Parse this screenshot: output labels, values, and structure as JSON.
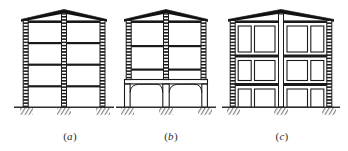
{
  "figure": {
    "domain": "Diagram",
    "kind": "structural-frame-elevation-set",
    "background_color": "#ffffff",
    "line_color": "#1a1a1a",
    "fill_color": "#111111",
    "ground_color": "#333333",
    "panels": [
      {
        "id": "a",
        "caption_open": "(",
        "caption_letter": "a",
        "caption_close": ")",
        "label": "(a)",
        "type": "uniform-bare-frame",
        "bays": 2,
        "stories": 4,
        "columns": 3,
        "beam_levels": 4,
        "ground_story": "same-as-upper",
        "infill": "none",
        "roof": "dark-peaked-gable",
        "supports": 3,
        "support_type": "fixed-hatched"
      },
      {
        "id": "b",
        "caption_open": "(",
        "caption_letter": "b",
        "caption_close": ")",
        "label": "(b)",
        "type": "soft-storey-frame",
        "bays": 2,
        "stories": 4,
        "columns": 3,
        "beam_levels": 3,
        "ground_story": "open-tall-haunched",
        "infill": "none-at-ground",
        "roof": "dark-peaked-gable",
        "supports": 3,
        "support_type": "fixed-hatched"
      },
      {
        "id": "c",
        "caption_open": "(",
        "caption_letter": "c",
        "caption_close": ")",
        "label": "(c)",
        "type": "infilled-frame-with-openings",
        "bays": 4,
        "stories": 3,
        "columns": 2,
        "beam_levels": 3,
        "ground_story": "infilled-with-door-openings",
        "infill": "masonry-panels-with-window-openings",
        "roof": "dark-peaked-gable",
        "supports": 3,
        "support_type": "fixed-hatched"
      }
    ]
  }
}
